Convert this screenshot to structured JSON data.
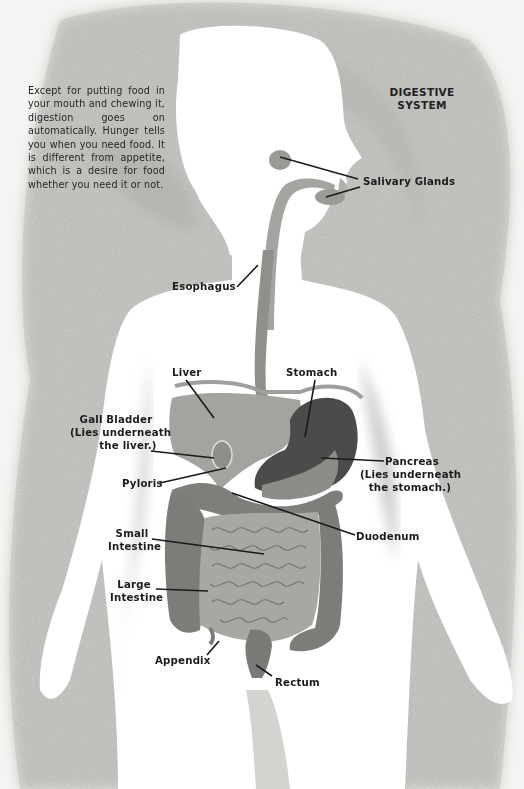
{
  "title": {
    "line1": "DIGESTIVE",
    "line2": "SYSTEM"
  },
  "intro_text": "Except for putting food in your mouth and chewing it, digestion goes on automatically. Hunger tells you when you need food. It is different from appetite, which is a desire for food whether you need it or not.",
  "labels": {
    "salivary_glands": "Salivary Glands",
    "esophagus": "Esophagus",
    "liver": "Liver",
    "stomach": "Stomach",
    "gall_bladder": {
      "line1": "Gall Bladder",
      "line2": "(Lies underneath",
      "line3": "the liver.)"
    },
    "pancreas": {
      "line1": "Pancreas",
      "line2": "(Lies underneath",
      "line3": "the stomach.)"
    },
    "pyloris": "Pyloris",
    "duodenum": "Duodenum",
    "small_intestine": {
      "line1": "Small",
      "line2": "Intestine"
    },
    "large_intestine": {
      "line1": "Large",
      "line2": "Intestine"
    },
    "appendix": "Appendix",
    "rectum": "Rectum"
  },
  "colors": {
    "background": "#f4f4f2",
    "texture": "#b9b9b6",
    "silhouette": "#ffffff",
    "organ_light": "#a9a9a6",
    "organ_mid": "#8a8a87",
    "organ_dark": "#4a4a48",
    "leader_line": "#1a1a1a"
  }
}
